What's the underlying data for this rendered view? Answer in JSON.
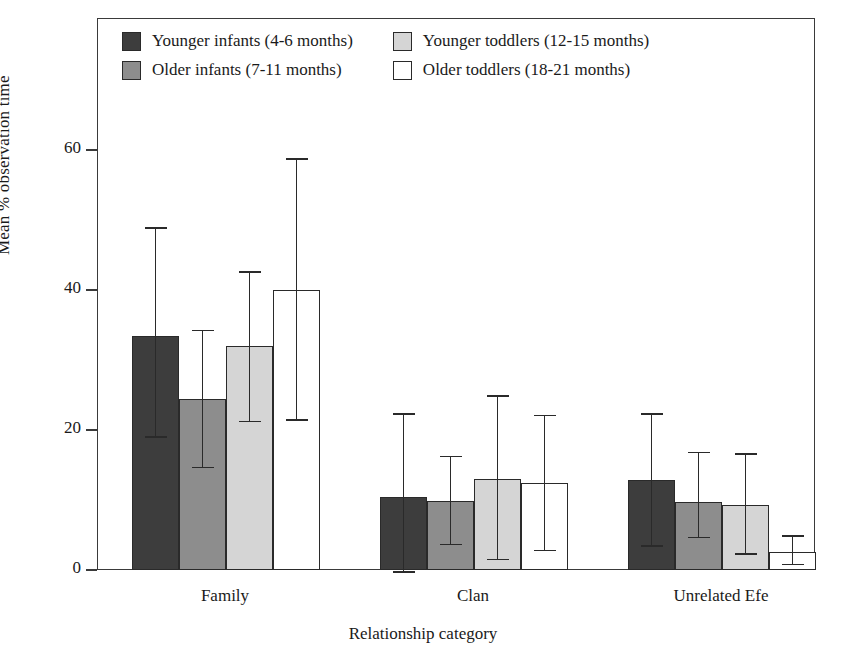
{
  "figure": {
    "background": "#ffffff",
    "frame_color": "#3a3a3a"
  },
  "legend": {
    "position": "inside-top-left",
    "items": [
      {
        "label": "Younger infants (4-6 months)",
        "color": "#3d3d3d",
        "swatch": "legend-swatch-younger-infants"
      },
      {
        "label": "Older infants (7-11 months)",
        "color": "#8d8d8d",
        "swatch": "legend-swatch-older-infants"
      },
      {
        "label": "Younger toddlers (12-15 months)",
        "color": "#d5d5d5",
        "swatch": "legend-swatch-younger-toddlers"
      },
      {
        "label": "Older toddlers (18-21 months)",
        "color": "#ffffff",
        "swatch": "legend-swatch-older-toddlers"
      }
    ]
  },
  "axes": {
    "y_title": "Mean % observation time",
    "x_title": "Relationship category",
    "y_ticks": [
      "0",
      "20",
      "40",
      "60"
    ],
    "x_ticks": [
      "Family",
      "Clan",
      "Unrelated Efe"
    ]
  },
  "chart_data": {
    "type": "bar",
    "title": "",
    "xlabel": "Relationship category",
    "ylabel": "Mean % observation time",
    "ylim": [
      0,
      68
    ],
    "yticks": [
      0,
      20,
      40,
      60
    ],
    "grid": false,
    "legend_position": "upper left (inside plot)",
    "error_bars": "asymmetric vertical range bars with caps",
    "categories": [
      "Family",
      "Clan",
      "Unrelated Efe"
    ],
    "series": [
      {
        "name": "Younger infants (4-6 months)",
        "color": "#3d3d3d",
        "values": [
          33.4,
          10.5,
          12.8
        ],
        "err_low": [
          18.9,
          -0.4,
          3.3
        ],
        "err_high": [
          49.0,
          22.4,
          22.4
        ]
      },
      {
        "name": "Older infants (7-11 months)",
        "color": "#8d8d8d",
        "values": [
          24.5,
          9.8,
          9.7
        ],
        "err_low": [
          14.5,
          3.5,
          4.5
        ],
        "err_high": [
          34.3,
          16.3,
          16.9
        ]
      },
      {
        "name": "Younger toddlers (12-15 months)",
        "color": "#d5d5d5",
        "values": [
          32.0,
          13.0,
          9.3
        ],
        "err_low": [
          21.1,
          1.4,
          2.2
        ],
        "err_high": [
          42.7,
          25.0,
          16.7
        ]
      },
      {
        "name": "Older toddlers (18-21 months)",
        "color": "#ffffff",
        "values": [
          40.0,
          12.5,
          2.6
        ],
        "err_low": [
          21.3,
          2.7,
          0.7
        ],
        "err_high": [
          58.8,
          22.2,
          5.0
        ]
      }
    ]
  }
}
